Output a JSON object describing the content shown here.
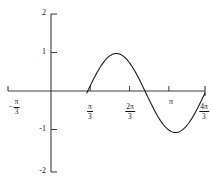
{
  "chart_data": {
    "type": "line",
    "title": "",
    "subtitle": "",
    "xlabel": "",
    "ylabel": "",
    "xlim": [
      -1.0471975512,
      4.1887902048
    ],
    "ylim": [
      -2,
      2
    ],
    "grid": false,
    "legend": null,
    "function": "y = sin(x - pi/3)",
    "x_tick_labels": [
      {
        "value": -1.0471975512,
        "display": "-π/3",
        "sign": "−",
        "numerator": "π",
        "denominator": "3",
        "has_tick_mark": true
      },
      {
        "value": 1.0471975512,
        "display": "π/3",
        "sign": "",
        "numerator": "π",
        "denominator": "3",
        "has_tick_mark": true
      },
      {
        "value": 2.0943951024,
        "display": "2π/3",
        "sign": "",
        "numerator": "2π",
        "denominator": "3",
        "has_tick_mark": true
      },
      {
        "value": 3.1415926536,
        "display": "π",
        "sign": "",
        "numerator": "π",
        "denominator": "",
        "has_tick_mark": true
      },
      {
        "value": 4.1887902048,
        "display": "4π/3",
        "sign": "",
        "numerator": "4π",
        "denominator": "3",
        "has_tick_mark": true
      }
    ],
    "y_tick_labels": [
      {
        "value": 2,
        "display": "2"
      },
      {
        "value": 1,
        "display": "1"
      },
      {
        "value": -1,
        "display": "-1"
      },
      {
        "value": -2,
        "display": "-2"
      }
    ],
    "key_points": [
      {
        "x": 1.0471975512,
        "y": 0,
        "note": "zero crossing ascending at π/3"
      },
      {
        "x": 2.617993878,
        "y": 1,
        "note": "maximum value 1"
      },
      {
        "x": 4.1887902048,
        "y": 0,
        "note": "zero crossing descending"
      },
      {
        "x": 5.7595865316,
        "y": -1,
        "note": "minimum value -1"
      }
    ],
    "series": [
      {
        "name": "sin(x - π/3)",
        "color": "#1a1a1a",
        "x": [
          1.0472,
          1.1472,
          1.2472,
          1.3472,
          1.4472,
          1.5472,
          1.6472,
          1.7472,
          1.8472,
          1.9472,
          2.0472,
          2.1472,
          2.2472,
          2.3472,
          2.4472,
          2.5472,
          2.6472,
          2.7472,
          2.8472,
          2.9472,
          3.0472,
          3.1472,
          3.2472,
          3.3472,
          3.4472,
          3.5472,
          3.6472,
          3.7472,
          3.8472,
          3.9472,
          4.0472,
          4.1472,
          4.1888
        ],
        "y": [
          0.0,
          0.0998,
          0.1987,
          0.2955,
          0.3894,
          0.4794,
          0.5646,
          0.6442,
          0.7174,
          0.7833,
          0.8415,
          0.8912,
          0.932,
          0.9636,
          0.9854,
          0.9975,
          0.9996,
          0.9917,
          0.9738,
          0.9463,
          0.9093,
          0.8632,
          0.8085,
          0.7457,
          0.6755,
          0.5985,
          0.5155,
          0.4274,
          0.335,
          0.2392,
          0.1411,
          0.0416,
          0.0
        ]
      }
    ],
    "axis_style": {
      "x_axis_y_value": 0,
      "y_axis_x_value": 0,
      "spine_color": "#3a3a3a",
      "tick_direction": "out"
    }
  }
}
